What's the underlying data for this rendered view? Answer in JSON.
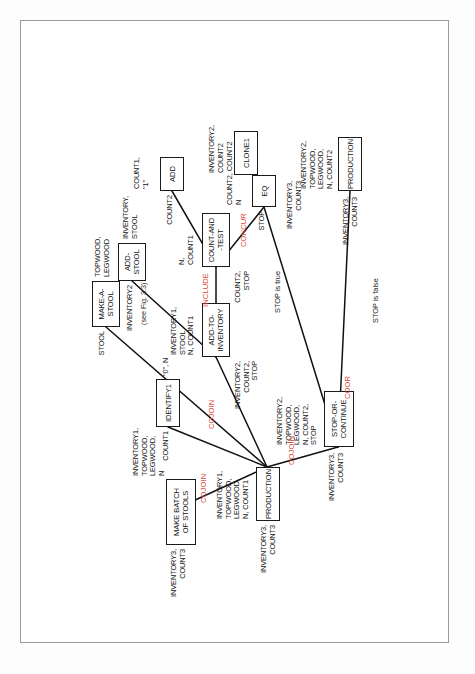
{
  "figure": {
    "kind": "structured-analysis-decomposition-diagram",
    "page_border_color": "#9a9a9a",
    "line_color": "#111111",
    "operator_color": "#d9453a",
    "text_color": "#111111",
    "rotation": "page content rotated 90 degrees counter-clockwise"
  },
  "nodes": [
    {
      "id": "make-batch-of-stools",
      "label": "MAKE BATCH\nOF STOOLS"
    },
    {
      "id": "identify1",
      "label": "IDENTIFY1"
    },
    {
      "id": "production-top",
      "label": "PRODUCTION"
    },
    {
      "id": "make-a-stool",
      "label": "MAKE-A-\nSTOOL"
    },
    {
      "id": "add-stool",
      "label": "ADD-\nSTOOL"
    },
    {
      "id": "add-to-inventory",
      "label": "ADD-TO-\nINVENTORY"
    },
    {
      "id": "count-and-test",
      "label": "COUNT-AND\n-TEST"
    },
    {
      "id": "add",
      "label": "ADD"
    },
    {
      "id": "eq",
      "label": "EQ"
    },
    {
      "id": "clone1",
      "label": "CLONE1"
    },
    {
      "id": "stop-or-continue",
      "label": "STOP-OR-\nCONTINUE"
    },
    {
      "id": "production-bottom",
      "label": "PRODUCTION"
    }
  ],
  "port_labels": {
    "make_batch_input": "INVENTORY3,\nCOUNT3",
    "make_batch_output": "INVENTORY1,\nTOPWOOD,\nLEGWOOD,\nN",
    "identify1_input": "COUNT1",
    "identify1_output": "\"0\", N",
    "production_top_output": "INVENTORY1,\nTOPWOOD,\nLEGWOOD,\nN, COUNT1",
    "production_top_input": "INVENTORY3,\nCOUNT3",
    "make_a_stool_input": "STOOL",
    "make_a_stool_output": "TOPWOOD,\nLEGWOOD",
    "add_stool_input": "INVENTORY2",
    "add_stool_output": "INVENTORY,\nSTOOL",
    "add_to_inventory_input": "INVENTORY2,\nCOUNT2,\nSTOP",
    "add_to_inventory_output": "INVENTORY1,\nSTOOL\nN, COUNT1",
    "count_and_test_input": "COUNT2,\nSTOP",
    "count_and_test_output": "N,\nCOUNT1",
    "add_input": "COUNT2",
    "add_output": "COUNT1,\n\"1\"",
    "eq_input": "STOP",
    "eq_output": "COUNT2, COUNT2\nN",
    "clone1_input": "INVENTORY3,\nCOUNT3",
    "clone1_output": "INVENTORY2,\nCOUNT2",
    "stop_or_continue_input": "INVENTORY3,\nCOUNT3",
    "stop_or_continue_output": "INVENTORY2,\nTOPWOOD,\nLEGWOOD,\nN, COUNT2,\nSTOP",
    "production_bottom_input": "INVENTORY3,\nCOUNT3",
    "production_bottom_output": "INVENTORY2,\nTOPWOOD,\nLEGWOOD,\nN, COUNT2"
  },
  "operators": [
    {
      "id": "cojoin-1",
      "label": "COJOIN"
    },
    {
      "id": "cojoin-2",
      "label": "COJOIN"
    },
    {
      "id": "cojoin-3",
      "label": "COJOIN"
    },
    {
      "id": "include",
      "label": "INCLUDE"
    },
    {
      "id": "concur",
      "label": "CONCUR"
    },
    {
      "id": "coor",
      "label": "COOR"
    }
  ],
  "conditions": [
    {
      "id": "stop-is-true",
      "label": "STOP is true"
    },
    {
      "id": "stop-is-false",
      "label": "STOP is false"
    }
  ],
  "notes": [
    {
      "id": "see-fig-note",
      "label": "(see Fig. 3.3)"
    }
  ]
}
